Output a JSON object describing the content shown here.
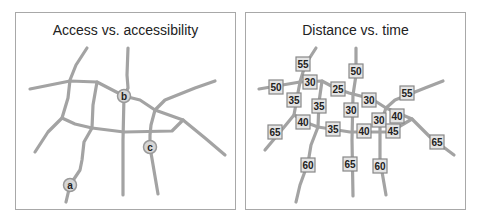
{
  "panels": [
    {
      "title": "Access vs. accessibility",
      "nodes": [
        {
          "label": "a",
          "x": 70,
          "y": 185
        },
        {
          "label": "b",
          "x": 124,
          "y": 96
        },
        {
          "label": "c",
          "x": 150,
          "y": 147
        }
      ]
    },
    {
      "title": "Distance vs. time",
      "speed_signs": [
        {
          "label": "55",
          "x": 303,
          "y": 64
        },
        {
          "label": "50",
          "x": 276,
          "y": 87
        },
        {
          "label": "30",
          "x": 310,
          "y": 82
        },
        {
          "label": "25",
          "x": 338,
          "y": 89
        },
        {
          "label": "50",
          "x": 356,
          "y": 71
        },
        {
          "label": "35",
          "x": 294,
          "y": 100
        },
        {
          "label": "35",
          "x": 319,
          "y": 106
        },
        {
          "label": "30",
          "x": 351,
          "y": 110
        },
        {
          "label": "30",
          "x": 369,
          "y": 100
        },
        {
          "label": "55",
          "x": 407,
          "y": 93
        },
        {
          "label": "40",
          "x": 303,
          "y": 122
        },
        {
          "label": "35",
          "x": 333,
          "y": 129
        },
        {
          "label": "40",
          "x": 364,
          "y": 131
        },
        {
          "label": "30",
          "x": 379,
          "y": 120
        },
        {
          "label": "40",
          "x": 397,
          "y": 116
        },
        {
          "label": "45",
          "x": 393,
          "y": 131
        },
        {
          "label": "65",
          "x": 275,
          "y": 132
        },
        {
          "label": "65",
          "x": 437,
          "y": 142
        },
        {
          "label": "60",
          "x": 308,
          "y": 165
        },
        {
          "label": "65",
          "x": 350,
          "y": 164
        },
        {
          "label": "60",
          "x": 380,
          "y": 166
        }
      ]
    }
  ]
}
